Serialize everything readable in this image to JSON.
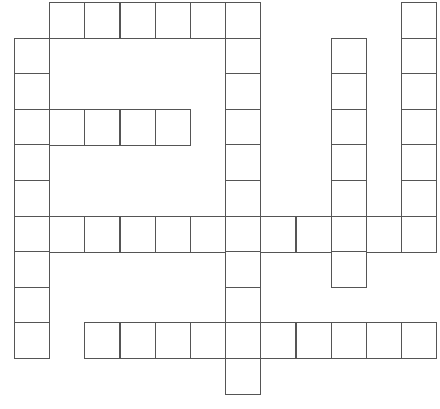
{
  "puzzle": {
    "type": "crossword",
    "grid": {
      "origin_x": 14,
      "origin_y": 2,
      "cell_w": 35.2,
      "cell_h": 35.6,
      "cols": 12,
      "rows": 11
    },
    "colors": {
      "line": "#555555",
      "cell_fill": "#ffffff",
      "background": "#ffffff"
    },
    "entries": [
      {
        "id": "across-top",
        "direction": "across",
        "row": 0,
        "col": 1,
        "length": 6
      },
      {
        "id": "down-left",
        "direction": "down",
        "row": 1,
        "col": 0,
        "length": 9
      },
      {
        "id": "across-short",
        "direction": "across",
        "row": 3,
        "col": 0,
        "length": 5
      },
      {
        "id": "down-center",
        "direction": "down",
        "row": 0,
        "col": 6,
        "length": 11
      },
      {
        "id": "down-right-inner",
        "direction": "down",
        "row": 1,
        "col": 9,
        "length": 7
      },
      {
        "id": "down-right-outer",
        "direction": "down",
        "row": 0,
        "col": 11,
        "length": 7
      },
      {
        "id": "across-middle",
        "direction": "across",
        "row": 6,
        "col": 0,
        "length": 12
      },
      {
        "id": "across-bottom",
        "direction": "across",
        "row": 9,
        "col": 2,
        "length": 10
      }
    ]
  }
}
